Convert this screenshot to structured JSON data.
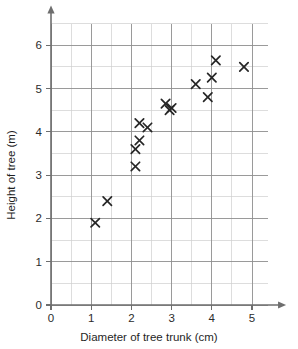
{
  "chart_data": {
    "type": "scatter",
    "title": "",
    "subtitle": "",
    "xlabel": "Diameter of tree trunk (cm)",
    "ylabel": "Height of tree (m)",
    "xlim": [
      0,
      5.4
    ],
    "ylim": [
      0,
      6.5
    ],
    "xticks": [
      0,
      1,
      2,
      3,
      4,
      5
    ],
    "yticks": [
      0,
      1,
      2,
      3,
      4,
      5,
      6
    ],
    "xtick_labels": [
      "0",
      "1",
      "2",
      "3",
      "4",
      "5"
    ],
    "ytick_labels": [
      "0",
      "1",
      "2",
      "3",
      "4",
      "5",
      "6"
    ],
    "x_minor_step": 0.5,
    "y_minor_step": 0.5,
    "grid": true,
    "grid_major_color": "#8f8f8f",
    "grid_minor_color": "#cfcfcf",
    "axis_color": "#6e6e6e",
    "marker": "x",
    "marker_color": "#262626",
    "legend": null,
    "annotations": [],
    "points": [
      {
        "x": 1.1,
        "y": 1.9
      },
      {
        "x": 1.4,
        "y": 2.4
      },
      {
        "x": 2.1,
        "y": 3.2
      },
      {
        "x": 2.1,
        "y": 3.6
      },
      {
        "x": 2.2,
        "y": 3.8
      },
      {
        "x": 2.2,
        "y": 4.2
      },
      {
        "x": 2.4,
        "y": 4.1
      },
      {
        "x": 2.85,
        "y": 4.65
      },
      {
        "x": 2.95,
        "y": 4.5
      },
      {
        "x": 3.0,
        "y": 4.55
      },
      {
        "x": 3.6,
        "y": 5.1
      },
      {
        "x": 3.9,
        "y": 4.8
      },
      {
        "x": 4.0,
        "y": 5.25
      },
      {
        "x": 4.1,
        "y": 5.65
      },
      {
        "x": 4.8,
        "y": 5.5
      }
    ]
  },
  "figure": {
    "x_axis_title": "Diameter of tree trunk (cm)",
    "y_axis_title": "Height of tree (m)"
  }
}
